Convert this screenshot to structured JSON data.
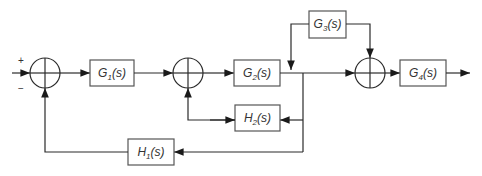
{
  "diagram": {
    "type": "control-system-block-diagram",
    "input_signs": {
      "plus": "+",
      "minus": "−"
    },
    "blocks": {
      "G1": {
        "name": "G",
        "sub": "1",
        "arg": "(s)"
      },
      "G2": {
        "name": "G",
        "sub": "2",
        "arg": "(s)"
      },
      "G3": {
        "name": "G",
        "sub": "3",
        "arg": "(s)"
      },
      "G4": {
        "name": "G",
        "sub": "4",
        "arg": "(s)"
      },
      "H1": {
        "name": "H",
        "sub": "1",
        "arg": "(s)"
      },
      "H2": {
        "name": "H",
        "sub": "2",
        "arg": "(s)"
      }
    },
    "summing_junctions": [
      "S1",
      "S2",
      "S3"
    ],
    "connections": [
      "input -> S1 (+)",
      "S1 -> G1",
      "G1 -> S2",
      "S2 -> G2",
      "G2 -> branch",
      "branch -> S3",
      "branch -> H2",
      "H2 -> S2 (feedback)",
      "branch -> H1",
      "H1 -> S1 (−)",
      "G3 -> S3",
      "G3 -> G2 output node",
      "S3 -> G4",
      "G4 -> output"
    ]
  }
}
